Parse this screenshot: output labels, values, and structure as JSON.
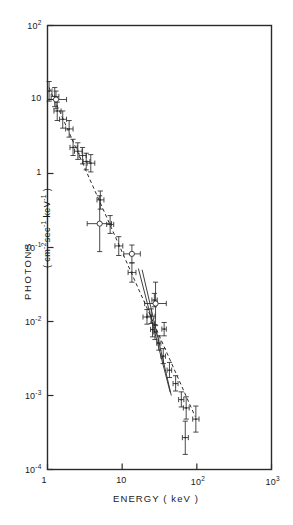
{
  "chart_data": {
    "type": "scatter",
    "title": "",
    "xlabel": "ENERGY ( keV )",
    "ylabel": "PHOTONS",
    "ylabel_units": "( cm-2sec-1 keV-1 )",
    "xscale": "log",
    "yscale": "log",
    "xlim": [
      1,
      1000
    ],
    "ylim": [
      0.0001,
      100
    ],
    "grid": false,
    "legend": null,
    "xticks": [
      {
        "value": 1,
        "label": "1"
      },
      {
        "value": 10,
        "label": "10"
      },
      {
        "value": 100,
        "label": "10",
        "exp": "2"
      },
      {
        "value": 1000,
        "label": "10",
        "exp": "3"
      }
    ],
    "yticks": [
      {
        "value": 100,
        "label": "10",
        "exp": "2"
      },
      {
        "value": 10,
        "label": "10"
      },
      {
        "value": 1,
        "label": "1"
      },
      {
        "value": 0.1,
        "label": "10",
        "exp": "-1"
      },
      {
        "value": 0.01,
        "label": "10",
        "exp": "-2"
      },
      {
        "value": 0.001,
        "label": "10",
        "exp": "-3"
      },
      {
        "value": 0.0001,
        "label": "10",
        "exp": "-4"
      }
    ],
    "series": [
      {
        "name": "cross-markers",
        "marker": "cross",
        "points": [
          {
            "x": 1.05,
            "y": 13.0,
            "ylo": 9.5,
            "yhi": 17.5,
            "xlo": 1.0,
            "xhi": 1.15
          },
          {
            "x": 1.25,
            "y": 11.0,
            "ylo": 8.0,
            "yhi": 14.5,
            "xlo": 1.12,
            "xhi": 1.42
          },
          {
            "x": 1.35,
            "y": 7.0,
            "ylo": 5.2,
            "yhi": 9.2,
            "xlo": 1.22,
            "xhi": 1.52
          },
          {
            "x": 1.6,
            "y": 5.4,
            "ylo": 4.1,
            "yhi": 7.0,
            "xlo": 1.45,
            "xhi": 1.8
          },
          {
            "x": 1.95,
            "y": 4.0,
            "ylo": 3.1,
            "yhi": 5.2,
            "xlo": 1.75,
            "xhi": 2.2
          },
          {
            "x": 2.2,
            "y": 2.25,
            "ylo": 1.75,
            "yhi": 2.9,
            "xlo": 2.0,
            "xhi": 2.5
          },
          {
            "x": 2.55,
            "y": 2.0,
            "ylo": 1.55,
            "yhi": 2.6,
            "xlo": 2.3,
            "xhi": 2.9
          },
          {
            "x": 2.95,
            "y": 1.75,
            "ylo": 1.35,
            "yhi": 2.25,
            "xlo": 2.65,
            "xhi": 3.3
          },
          {
            "x": 3.3,
            "y": 1.45,
            "ylo": 1.12,
            "yhi": 1.88,
            "xlo": 3.0,
            "xhi": 3.7
          },
          {
            "x": 3.8,
            "y": 1.38,
            "ylo": 1.05,
            "yhi": 1.8,
            "xlo": 3.4,
            "xhi": 4.3
          },
          {
            "x": 5.1,
            "y": 0.44,
            "ylo": 0.33,
            "yhi": 0.58,
            "xlo": 4.6,
            "xhi": 5.7
          },
          {
            "x": 6.9,
            "y": 0.205,
            "ylo": 0.155,
            "yhi": 0.27,
            "xlo": 6.2,
            "xhi": 7.7
          },
          {
            "x": 9.0,
            "y": 0.105,
            "ylo": 0.078,
            "yhi": 0.14,
            "xlo": 8.0,
            "xhi": 10.2
          },
          {
            "x": 13.5,
            "y": 0.046,
            "ylo": 0.034,
            "yhi": 0.062,
            "xlo": 12.0,
            "xhi": 15.3
          },
          {
            "x": 21.5,
            "y": 0.0115,
            "ylo": 0.0092,
            "yhi": 0.0145,
            "xlo": 19.0,
            "xhi": 24.5
          },
          {
            "x": 24.5,
            "y": 0.0118,
            "ylo": 0.0094,
            "yhi": 0.0148,
            "xlo": 21.5,
            "xhi": 27.5
          },
          {
            "x": 27.0,
            "y": 0.0195,
            "ylo": 0.0158,
            "yhi": 0.024,
            "xlo": 25.0,
            "xhi": 29.5
          },
          {
            "x": 25.5,
            "y": 0.0078,
            "ylo": 0.0062,
            "yhi": 0.0098,
            "xlo": 24.0,
            "xhi": 27.0
          },
          {
            "x": 27.5,
            "y": 0.0072,
            "ylo": 0.0057,
            "yhi": 0.0091,
            "xlo": 26.0,
            "xhi": 29.0
          },
          {
            "x": 31.0,
            "y": 0.0051,
            "ylo": 0.0041,
            "yhi": 0.0064,
            "xlo": 29.0,
            "xhi": 33.0
          },
          {
            "x": 36.5,
            "y": 0.0079,
            "ylo": 0.0064,
            "yhi": 0.0097,
            "xlo": 34.0,
            "xhi": 39.0
          },
          {
            "x": 35.5,
            "y": 0.0034,
            "ylo": 0.0027,
            "yhi": 0.0043,
            "xlo": 33.0,
            "xhi": 38.0
          },
          {
            "x": 43.0,
            "y": 0.0022,
            "ylo": 0.00175,
            "yhi": 0.0028,
            "xlo": 40.0,
            "xhi": 46.0
          },
          {
            "x": 52.0,
            "y": 0.00145,
            "ylo": 0.00115,
            "yhi": 0.00185,
            "xlo": 48.0,
            "xhi": 56.0
          },
          {
            "x": 62.0,
            "y": 0.00088,
            "ylo": 0.0007,
            "yhi": 0.00112,
            "xlo": 57.0,
            "xhi": 67.0
          },
          {
            "x": 72.0,
            "y": 0.00068,
            "ylo": 0.00048,
            "yhi": 0.00096,
            "xlo": 66.0,
            "xhi": 79.0
          },
          {
            "x": 70.0,
            "y": 0.00027,
            "ylo": 0.00016,
            "yhi": 0.00045,
            "xlo": 64.0,
            "xhi": 77.0
          },
          {
            "x": 97.0,
            "y": 0.00048,
            "ylo": 0.00032,
            "yhi": 0.00072,
            "xlo": 88.0,
            "xhi": 107.0
          }
        ]
      },
      {
        "name": "open-circle-markers",
        "marker": "circle",
        "points": [
          {
            "x": 1.3,
            "y": 10.0,
            "ylo": 7.5,
            "yhi": 13.0,
            "xlo": 1.0,
            "xhi": 1.8
          },
          {
            "x": 5.0,
            "y": 0.21,
            "ylo": 0.088,
            "yhi": 0.5,
            "xlo": 3.4,
            "xhi": 7.2
          },
          {
            "x": 13.5,
            "y": 0.082,
            "ylo": 0.062,
            "yhi": 0.108,
            "xlo": 10.5,
            "xhi": 17.5
          },
          {
            "x": 28.0,
            "y": 0.0175,
            "ylo": 0.0088,
            "yhi": 0.034,
            "xlo": 20.0,
            "xhi": 39.0
          }
        ]
      }
    ],
    "fit_lines": [
      {
        "name": "dashed-power-law",
        "style": "dashed",
        "x1": 1.05,
        "y1": 14.5,
        "x2": 95.0,
        "y2": 0.00052
      },
      {
        "name": "solid-steep-upper",
        "style": "solid",
        "x1": 16.5,
        "y1": 0.052,
        "x2": 44.0,
        "y2": 0.0011
      },
      {
        "name": "solid-steep-lower",
        "style": "solid",
        "x1": 18.5,
        "y1": 0.05,
        "x2": 45.5,
        "y2": 0.001
      }
    ]
  },
  "axes": {
    "x_title": "ENERGY ( keV )",
    "y_title": "PHOTONS",
    "y_units_open": "(",
    "y_units_cm": "cm",
    "y_units_cm_exp": "-2",
    "y_units_sec": "sec",
    "y_units_sec_exp": "-1",
    "y_units_kev": "keV",
    "y_units_kev_exp": "-1",
    "y_units_close": ")"
  }
}
